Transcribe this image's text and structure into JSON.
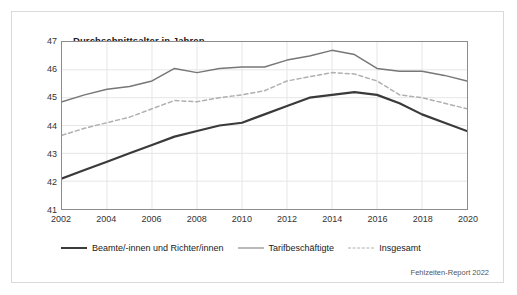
{
  "figure": {
    "title": "Durchschnittsalter in Jahren",
    "source_note": "Fehlzeiten-Report 2022"
  },
  "colors": {
    "beamte": "#3a3a3a",
    "tarifbeschaeftigte": "#777777",
    "insgesamt": "#b0b0b0",
    "grid": "#e6e6e6",
    "axis": "#8c8c8c",
    "frame": "#d9d9d9",
    "text": "#1a1a1a"
  },
  "chart_data": {
    "type": "line",
    "title": "Durchschnittsalter in Jahren",
    "xlabel": "",
    "ylabel": "Durchschnittsalter in Jahren",
    "xlim": [
      2002,
      2020
    ],
    "ylim": [
      41,
      47
    ],
    "grid": true,
    "legend_position": "bottom",
    "x": [
      2002,
      2003,
      2004,
      2005,
      2006,
      2007,
      2008,
      2009,
      2010,
      2011,
      2012,
      2013,
      2014,
      2015,
      2016,
      2017,
      2018,
      2019,
      2020
    ],
    "xticks": [
      2002,
      2004,
      2006,
      2008,
      2010,
      2012,
      2014,
      2016,
      2018,
      2020
    ],
    "yticks": [
      41,
      42,
      43,
      44,
      45,
      46,
      47
    ],
    "series": [
      {
        "name": "Beamte/-innen und Richter/innen",
        "style": "solid",
        "color": "#3a3a3a",
        "values": [
          42.1,
          42.4,
          42.7,
          43.0,
          43.3,
          43.6,
          43.8,
          44.0,
          44.1,
          44.4,
          44.7,
          45.0,
          45.1,
          45.2,
          45.1,
          44.8,
          44.4,
          44.1,
          43.8
        ]
      },
      {
        "name": "Tarifbeschäftigte",
        "style": "solid",
        "color": "#777777",
        "values": [
          44.85,
          45.1,
          45.3,
          45.4,
          45.6,
          46.05,
          45.9,
          46.05,
          46.1,
          46.1,
          46.35,
          46.5,
          46.7,
          46.55,
          46.05,
          45.95,
          45.95,
          45.8,
          45.6
        ]
      },
      {
        "name": "Insgesamt",
        "style": "dashed",
        "color": "#b0b0b0",
        "values": [
          43.65,
          43.9,
          44.1,
          44.3,
          44.6,
          44.9,
          44.85,
          45.0,
          45.1,
          45.25,
          45.6,
          45.75,
          45.9,
          45.85,
          45.6,
          45.1,
          45.0,
          44.8,
          44.6
        ]
      }
    ]
  },
  "legend": {
    "items": [
      {
        "label": "Beamte/-innen und Richter/innen",
        "swatch": "solid-dark-line-icon"
      },
      {
        "label": "Tarifbeschäftigte",
        "swatch": "solid-gray-line-icon"
      },
      {
        "label": "Insgesamt",
        "swatch": "dashed-gray-line-icon"
      }
    ]
  }
}
